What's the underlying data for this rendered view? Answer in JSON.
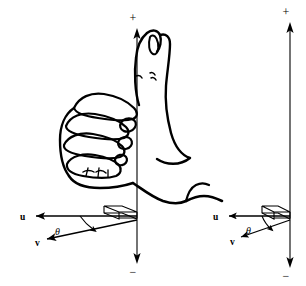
{
  "figure": {
    "background_color": "#ffffff",
    "ink_color": "#000000",
    "panels": [
      {
        "id": "left-panel",
        "name": "hand-and-vectors",
        "has_hand_illustration": true,
        "axis": {
          "name": "vertical-axis",
          "top_label": "+",
          "bottom_label": "−",
          "x": 137,
          "y_top": 30,
          "y_bottom": 262,
          "arrow_up": true,
          "arrow_down": true
        },
        "vectors": [
          {
            "name": "u",
            "label": "u",
            "label_x": 20,
            "label_y": 219,
            "from_x": 137,
            "from_y": 216,
            "to_x": 33,
            "to_y": 216,
            "direction": "left"
          },
          {
            "name": "v",
            "label": "v",
            "label_x": 36,
            "label_y": 244,
            "from_x": 137,
            "from_y": 220,
            "to_x": 45,
            "to_y": 239,
            "direction": "down-left"
          }
        ],
        "angle": {
          "name": "theta",
          "label": "θ",
          "label_x": 58,
          "label_y": 232,
          "between": [
            "u",
            "v"
          ]
        },
        "right_angle_marker": {
          "name": "perpendicular-box",
          "shape": "parallelogram",
          "x": 104,
          "y": 206
        }
      },
      {
        "id": "right-panel",
        "name": "vectors-only",
        "has_hand_illustration": false,
        "axis": {
          "name": "vertical-axis",
          "top_label": "+",
          "bottom_label": "−",
          "x": 290,
          "y_top": 22,
          "y_bottom": 268,
          "arrow_up": true,
          "arrow_down": true
        },
        "vectors": [
          {
            "name": "u",
            "label": "u",
            "label_x": 214,
            "label_y": 219,
            "from_x": 290,
            "from_y": 216,
            "to_x": 226,
            "to_y": 216,
            "direction": "left"
          },
          {
            "name": "v",
            "label": "v",
            "label_x": 231,
            "label_y": 243,
            "from_x": 290,
            "from_y": 220,
            "to_x": 239,
            "to_y": 238,
            "direction": "down-left"
          }
        ],
        "angle": {
          "name": "theta",
          "label": "θ",
          "label_x": 249,
          "label_y": 231,
          "between": [
            "u",
            "v"
          ]
        },
        "right_angle_marker": {
          "name": "perpendicular-box",
          "shape": "parallelogram",
          "x": 262,
          "y": 206
        }
      }
    ],
    "hand": {
      "name": "right-hand-thumbs-up",
      "description": "Closed right fist with thumb extended upward along the vertical axis",
      "parts": [
        "thumb",
        "index-finger",
        "middle-finger",
        "ring-finger",
        "little-finger",
        "knuckles",
        "wrist"
      ]
    }
  }
}
